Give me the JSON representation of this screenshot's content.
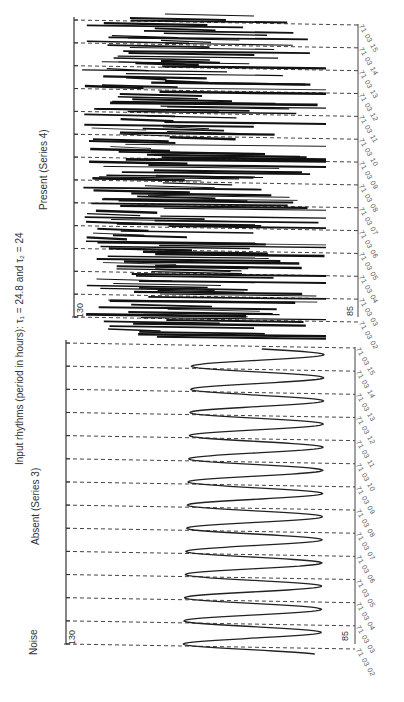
{
  "chart_data": [
    {
      "type": "line",
      "panel": "left (bottom in screenshot)",
      "noise_condition": "Absent",
      "title": "Absent (Series 3)",
      "description": "Pure sinusoidal input rhythm, double-plotted; one cycle per row",
      "x_label": "Time of day (one day per row)",
      "y_label": "",
      "ylim": [
        85,
        130
      ],
      "y_ticks": [
        130,
        85
      ],
      "rows": [
        "71 03 02",
        "71 03 03",
        "71 03 04",
        "71 03 05",
        "71 03 06",
        "71 03 07",
        "71 03 08",
        "71 03 09",
        "71 03 10",
        "71 03 11",
        "71 03 12",
        "71 03 13",
        "71 03 14",
        "71 03 15"
      ],
      "series": [
        {
          "name": "Series 3",
          "shape": "sine",
          "amplitude_range": [
            85,
            130
          ],
          "period_hours": 24.8
        }
      ]
    },
    {
      "type": "line",
      "panel": "right (top in screenshot)",
      "noise_condition": "Present",
      "title": "Present (Series 4)",
      "description": "Noisy input rhythm, double-plotted; one cycle per row",
      "x_label": "Time of day (one day per row)",
      "y_label": "",
      "ylim": [
        85,
        130
      ],
      "y_ticks": [
        130,
        85
      ],
      "rows": [
        "71 03 02",
        "71 03 03",
        "71 03 04",
        "71 03 05",
        "71 03 06",
        "71 03 07",
        "71 03 08",
        "71 03 09",
        "71 03 10",
        "71 03 11",
        "71 03 12",
        "71 03 13",
        "71 03 14",
        "71 03 15"
      ],
      "series": [
        {
          "name": "Series 4",
          "shape": "noisy",
          "amplitude_range": [
            85,
            130
          ],
          "period_hours": 24
        }
      ]
    }
  ],
  "figure": {
    "header": "Input rhythms (period in hours): τ₁ = 24.8 and τ₂ = 24",
    "noise_label": "Noise",
    "absent_label": "Absent  (Series  3)",
    "present_label": "Present  (Series  4)",
    "y_top": "130",
    "y_bottom": "85",
    "dates": [
      "71 03 02",
      "71 03 03",
      "71 03 04",
      "71 03 05",
      "71 03 06",
      "71 03 07",
      "71 03 08",
      "71 03 09",
      "71 03 10",
      "71 03 11",
      "71 03 12",
      "71 03 13",
      "71 03 14",
      "71 03 15"
    ]
  }
}
